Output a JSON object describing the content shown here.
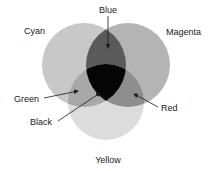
{
  "diagram": {
    "type": "venn",
    "circles": [
      {
        "name": "Cyan",
        "label": "Cyan",
        "cx": 84,
        "cy": 65,
        "r": 42,
        "fill": "#c8c8c8"
      },
      {
        "name": "Magenta",
        "label": "Magenta",
        "cx": 128,
        "cy": 65,
        "r": 42,
        "fill": "#b4b4b4"
      },
      {
        "name": "Yellow",
        "label": "Yellow",
        "cx": 106,
        "cy": 102,
        "r": 38,
        "fill": "#dcdcdc"
      }
    ],
    "overlaps": [
      {
        "label": "Blue",
        "between": [
          "Cyan",
          "Magenta"
        ],
        "fill": "#5a5a5a"
      },
      {
        "label": "Green",
        "between": [
          "Cyan",
          "Yellow"
        ],
        "fill": "#a8a8a8"
      },
      {
        "label": "Red",
        "between": [
          "Magenta",
          "Yellow"
        ],
        "fill": "#8e8e8e"
      },
      {
        "label": "Black",
        "between": [
          "Cyan",
          "Magenta",
          "Yellow"
        ],
        "fill": "#050505"
      }
    ],
    "labels": {
      "blue": "Blue",
      "cyan": "Cyan",
      "magenta": "Magenta",
      "green": "Green",
      "red": "Red",
      "black": "Black",
      "yellow": "Yellow"
    }
  }
}
